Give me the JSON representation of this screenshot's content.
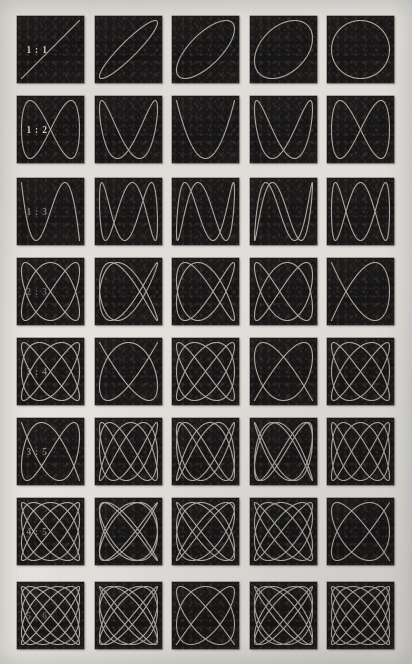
{
  "plate": {
    "title": "Lissajous Figures",
    "background_color": "#e8e6e1",
    "panel_color": "#191717",
    "curve_color": "#dedbd2",
    "columns": 5,
    "rows": 8,
    "phase_steps_deg": [
      0,
      22.5,
      45,
      67.5,
      90
    ],
    "geometry": {
      "col_x": [
        17,
        95,
        172,
        250,
        327
      ],
      "row_y": [
        16,
        96,
        178,
        258,
        338,
        418,
        498,
        582
      ],
      "cell_w": 67,
      "cell_h": 67
    }
  },
  "chart_data": {
    "type": "line",
    "xlabel": "",
    "ylabel": "",
    "phase_steps_deg": [
      0,
      22.5,
      45,
      67.5,
      90
    ],
    "series": [
      {
        "name": "1:1",
        "a": 1,
        "b": 1,
        "label": "1 : 1"
      },
      {
        "name": "1:2",
        "a": 1,
        "b": 2,
        "label": "1 : 2"
      },
      {
        "name": "1:3",
        "a": 1,
        "b": 3,
        "label": "1 : 3"
      },
      {
        "name": "2:3",
        "a": 2,
        "b": 3,
        "label": "2 : 3"
      },
      {
        "name": "3:4",
        "a": 3,
        "b": 4,
        "label": "3 : 4"
      },
      {
        "name": "3:5",
        "a": 3,
        "b": 5,
        "label": "3 : 5"
      },
      {
        "name": "4:5",
        "a": 4,
        "b": 5,
        "label": "4 : 5"
      },
      {
        "name": "5:6",
        "a": 5,
        "b": 6,
        "label": "5 : 6"
      }
    ]
  },
  "rows": [
    {
      "label": "1 : 1",
      "a": 1,
      "b": 1,
      "label_visibility": "normal"
    },
    {
      "label": "1 : 2",
      "a": 1,
      "b": 2,
      "label_visibility": "normal"
    },
    {
      "label": "1 : 3",
      "a": 1,
      "b": 3,
      "label_visibility": "faint"
    },
    {
      "label": "2 : 3",
      "a": 2,
      "b": 3,
      "label_visibility": "veryfaint"
    },
    {
      "label": "3 : 4",
      "a": 3,
      "b": 4,
      "label_visibility": "faint"
    },
    {
      "label": "3 : 5",
      "a": 3,
      "b": 5,
      "label_visibility": "faint"
    },
    {
      "label": "4 : 5",
      "a": 4,
      "b": 5,
      "label_visibility": "faint"
    },
    {
      "label": "5 : 6",
      "a": 5,
      "b": 6,
      "label_visibility": "veryfaint"
    }
  ]
}
